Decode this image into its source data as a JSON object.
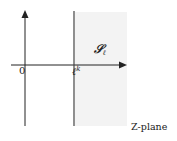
{
  "figure": {
    "plane_label": "Z-plane",
    "origin_label": "0",
    "line_label_base": "ℓ",
    "line_label_sup": "k",
    "region_label_base": "𝒮",
    "region_label_sub": "ℓ",
    "colors": {
      "axis": "#222222",
      "line": "#333333",
      "shaded_region": "#f3f3f3",
      "background": "#ffffff"
    }
  }
}
